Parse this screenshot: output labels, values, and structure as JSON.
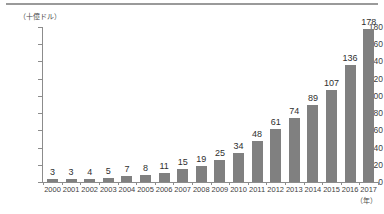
{
  "chart_data": {
    "type": "bar",
    "title": "",
    "subtitle": "",
    "xlabel": "（年）",
    "ylabel": "（十億ドル）",
    "categories": [
      "2000",
      "2001",
      "2002",
      "2003",
      "2004",
      "2005",
      "2006",
      "2007",
      "2008",
      "2009",
      "2010",
      "2011",
      "2012",
      "2013",
      "2014",
      "2015",
      "2016",
      "2017"
    ],
    "values": [
      3,
      3,
      4,
      5,
      7,
      8,
      11,
      15,
      19,
      25,
      34,
      48,
      61,
      74,
      89,
      107,
      136,
      178
    ],
    "value_labels": [
      "3",
      "3",
      "4",
      "5",
      "7",
      "8",
      "11",
      "15",
      "19",
      "25",
      "34",
      "48",
      "61",
      "74",
      "89",
      "107",
      "136",
      "178"
    ],
    "ylim": [
      0,
      180
    ],
    "ytick_values": [
      0,
      20,
      40,
      60,
      80,
      100,
      120,
      140,
      160,
      180
    ],
    "ytick_labels": [
      "0",
      "20",
      "40",
      "60",
      "80",
      "100",
      "120",
      "140",
      "160",
      "180"
    ],
    "grid": false,
    "legend": null,
    "legend_position": "none",
    "bar_color": "#808080",
    "axis_color": "#8c8c8c",
    "text_color": "#3a3a3a",
    "rule_color": "#9a9a9a",
    "annotations": []
  },
  "figure": {
    "unit_note": "（十億ドル）",
    "year_note": "（年）"
  }
}
